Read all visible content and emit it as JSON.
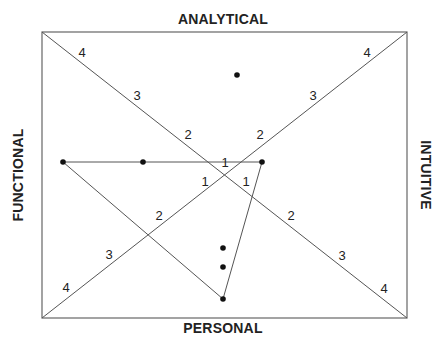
{
  "labels": {
    "top": "ANALYTICAL",
    "bottom": "PERSONAL",
    "left": "FUNCTIONAL",
    "right": "INTUITIVE"
  },
  "colors": {
    "line": "#555555",
    "text": "#222222",
    "dot": "#111111"
  },
  "box": {
    "x1": 42,
    "y1": 32,
    "x2": 407,
    "y2": 318
  },
  "diagonal_ticks": {
    "tl_br": [
      "4",
      "3",
      "2",
      "1",
      "1",
      "2",
      "3",
      "4"
    ],
    "bl_tr": [
      "4",
      "3",
      "2",
      "1",
      "1",
      "2",
      "3",
      "4"
    ]
  },
  "points": [
    {
      "x": 237,
      "y": 75
    },
    {
      "x": 63,
      "y": 162
    },
    {
      "x": 143,
      "y": 162
    },
    {
      "x": 262,
      "y": 162
    },
    {
      "x": 223,
      "y": 248
    },
    {
      "x": 223,
      "y": 267
    },
    {
      "x": 223,
      "y": 299
    }
  ],
  "triangle": [
    {
      "x": 63,
      "y": 162
    },
    {
      "x": 262,
      "y": 162
    },
    {
      "x": 223,
      "y": 299
    }
  ]
}
